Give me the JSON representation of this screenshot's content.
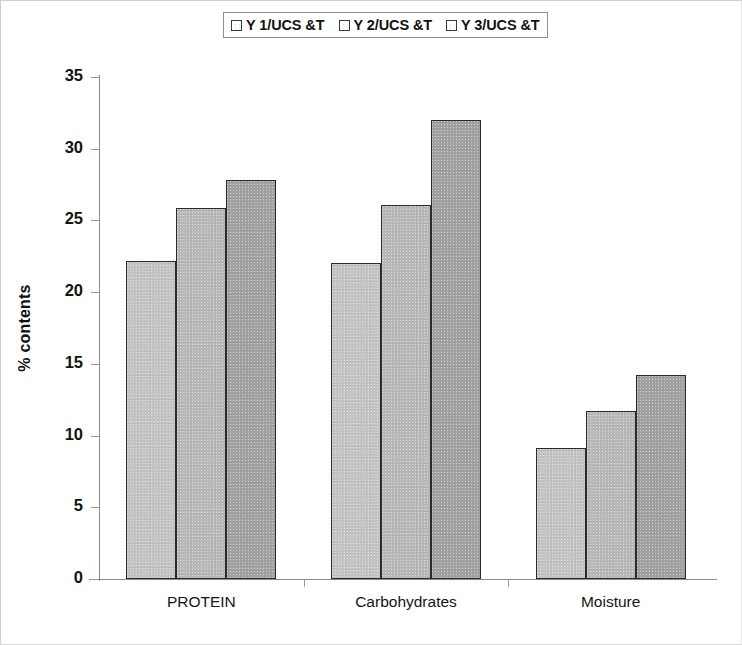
{
  "chart_data": {
    "type": "bar",
    "title": "",
    "subtitle": "",
    "xlabel": "",
    "ylabel": "% contents",
    "ylim": [
      0,
      35
    ],
    "yticks": [
      0,
      5,
      10,
      15,
      20,
      25,
      30,
      35
    ],
    "grid": false,
    "legend_position": "top-center",
    "categories": [
      "PROTEIN",
      "Carbohydrates",
      "Moisture"
    ],
    "series": [
      {
        "name": "Y 1/UCS &T",
        "values": [
          22.2,
          22.0,
          9.1
        ],
        "color": "#c4c4c4"
      },
      {
        "name": "Y 2/UCS &T",
        "values": [
          25.9,
          26.1,
          11.7
        ],
        "color": "#b9b9b9"
      },
      {
        "name": "Y 3/UCS &T",
        "values": [
          27.8,
          32.0,
          14.2
        ],
        "color": "#a2a2a2"
      }
    ]
  },
  "legend": {
    "entries": [
      {
        "label": "Y 1/UCS &T"
      },
      {
        "label": "Y 2/UCS &T"
      },
      {
        "label": "Y 3/UCS &T"
      }
    ]
  },
  "axes": {
    "y_title": "% contents",
    "y_tick_labels": [
      "35",
      "30",
      "25",
      "20",
      "15",
      "10",
      "5",
      "0"
    ],
    "x_tick_labels": [
      "PROTEIN",
      "Carbohydrates",
      "Moisture"
    ]
  },
  "colors": {
    "series_1": "#c4c4c4",
    "series_2": "#b9b9b9",
    "series_3": "#a2a2a2",
    "bar_outline": "#2b2b2b",
    "axis": "#8a8a8a",
    "text": "#141414"
  }
}
